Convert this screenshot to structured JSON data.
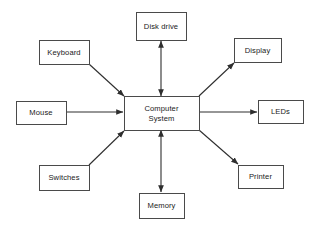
{
  "diagram": {
    "canvas": {
      "width": 318,
      "height": 229,
      "background": "#ffffff"
    },
    "style": {
      "box_stroke": "#4a4a4a",
      "box_fill": "#ffffff",
      "line_color": "#2e2e2e",
      "text_color": "#1a1a1a"
    },
    "center": {
      "id": "computer-system",
      "label_line1": "Computer",
      "label_line2": "System",
      "x": 124,
      "y": 96,
      "w": 75,
      "h": 34
    },
    "nodes": [
      {
        "id": "disk-drive",
        "label": "Disk drive",
        "x": 136,
        "y": 12,
        "w": 50,
        "h": 28
      },
      {
        "id": "keyboard",
        "label": "Keyboard",
        "x": 39,
        "y": 40,
        "w": 50,
        "h": 24
      },
      {
        "id": "display",
        "label": "Display",
        "x": 234,
        "y": 38,
        "w": 47,
        "h": 24
      },
      {
        "id": "mouse",
        "label": "Mouse",
        "x": 16,
        "y": 101,
        "w": 50,
        "h": 23
      },
      {
        "id": "leds",
        "label": "LEDs",
        "x": 258,
        "y": 100,
        "w": 45,
        "h": 23
      },
      {
        "id": "switches",
        "label": "Switches",
        "x": 39,
        "y": 165,
        "w": 50,
        "h": 25
      },
      {
        "id": "printer",
        "label": "Printer",
        "x": 238,
        "y": 165,
        "w": 45,
        "h": 23
      },
      {
        "id": "memory",
        "label": "Memory",
        "x": 139,
        "y": 193,
        "w": 45,
        "h": 25
      }
    ],
    "connections": [
      {
        "id": "conn-disk-drive",
        "from": "computer-system",
        "to": "disk-drive",
        "direction": "bidirectional",
        "orientation": "vertical",
        "x1": 161,
        "y1": 96,
        "x2": 161,
        "y2": 41
      },
      {
        "id": "conn-memory",
        "from": "computer-system",
        "to": "memory",
        "direction": "bidirectional",
        "orientation": "vertical",
        "x1": 161,
        "y1": 130,
        "x2": 161,
        "y2": 192
      },
      {
        "id": "conn-keyboard",
        "from": "keyboard",
        "to": "computer-system",
        "direction": "forward",
        "orientation": "diagonal",
        "x1": 89,
        "y1": 64,
        "x2": 124,
        "y2": 96
      },
      {
        "id": "conn-mouse",
        "from": "mouse",
        "to": "computer-system",
        "direction": "forward",
        "orientation": "horizontal",
        "x1": 66,
        "y1": 112,
        "x2": 123,
        "y2": 112
      },
      {
        "id": "conn-switches",
        "from": "switches",
        "to": "computer-system",
        "direction": "forward",
        "orientation": "diagonal",
        "x1": 89,
        "y1": 165,
        "x2": 124,
        "y2": 131
      },
      {
        "id": "conn-display",
        "from": "computer-system",
        "to": "display",
        "direction": "forward",
        "orientation": "diagonal",
        "x1": 199,
        "y1": 96,
        "x2": 234,
        "y2": 63
      },
      {
        "id": "conn-leds",
        "from": "computer-system",
        "to": "leds",
        "direction": "forward",
        "orientation": "horizontal",
        "x1": 199,
        "y1": 112,
        "x2": 257,
        "y2": 112
      },
      {
        "id": "conn-printer",
        "from": "computer-system",
        "to": "printer",
        "direction": "forward",
        "orientation": "diagonal",
        "x1": 199,
        "y1": 130,
        "x2": 238,
        "y2": 164
      }
    ]
  }
}
